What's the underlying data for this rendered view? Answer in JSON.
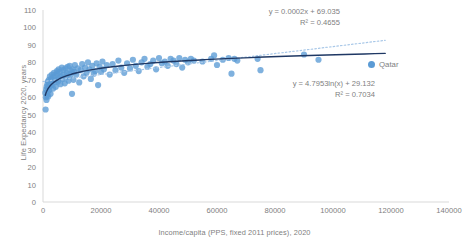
{
  "chart_data": {
    "type": "scatter",
    "title": "",
    "xlabel": "Income/capita (PPS, fixed 2011 prices), 2020",
    "ylabel": "Life Expectancy 2020, years",
    "xlim": [
      0,
      140000
    ],
    "ylim": [
      0,
      110
    ],
    "xticks": [
      0,
      20000,
      40000,
      60000,
      80000,
      100000,
      120000,
      140000
    ],
    "yticks": [
      0,
      10,
      20,
      30,
      40,
      50,
      60,
      70,
      80,
      90,
      100,
      110
    ],
    "grid": false,
    "legend_position": "right",
    "series": [
      {
        "name": "Qatar",
        "marker_color": "#5B9BD5",
        "points": [
          [
            800,
            62.5
          ],
          [
            900,
            53.0
          ],
          [
            1000,
            60.0
          ],
          [
            1100,
            64.5
          ],
          [
            1200,
            58.5
          ],
          [
            1250,
            66.0
          ],
          [
            1400,
            61.0
          ],
          [
            1500,
            67.5
          ],
          [
            1600,
            63.0
          ],
          [
            1700,
            69.0
          ],
          [
            1800,
            60.5
          ],
          [
            1900,
            65.5
          ],
          [
            2000,
            70.0
          ],
          [
            2100,
            64.0
          ],
          [
            2200,
            68.0
          ],
          [
            2400,
            72.0
          ],
          [
            2500,
            66.5
          ],
          [
            2600,
            62.0
          ],
          [
            2800,
            70.5
          ],
          [
            3000,
            67.0
          ],
          [
            3100,
            73.0
          ],
          [
            3300,
            69.5
          ],
          [
            3500,
            65.0
          ],
          [
            3600,
            71.5
          ],
          [
            3800,
            74.0
          ],
          [
            4000,
            68.5
          ],
          [
            4200,
            72.5
          ],
          [
            4400,
            66.0
          ],
          [
            4600,
            70.0
          ],
          [
            4800,
            75.0
          ],
          [
            5000,
            73.5
          ],
          [
            5200,
            69.0
          ],
          [
            5400,
            76.0
          ],
          [
            5600,
            71.0
          ],
          [
            5800,
            74.5
          ],
          [
            6000,
            67.5
          ],
          [
            6200,
            72.0
          ],
          [
            6500,
            77.0
          ],
          [
            6800,
            70.5
          ],
          [
            7000,
            75.5
          ],
          [
            7200,
            73.0
          ],
          [
            7500,
            68.0
          ],
          [
            7800,
            76.5
          ],
          [
            8000,
            71.5
          ],
          [
            8200,
            74.0
          ],
          [
            8500,
            77.5
          ],
          [
            8800,
            69.5
          ],
          [
            9000,
            73.5
          ],
          [
            9200,
            78.0
          ],
          [
            9500,
            72.5
          ],
          [
            9800,
            75.0
          ],
          [
            10000,
            62.0
          ],
          [
            10200,
            76.0
          ],
          [
            10500,
            70.0
          ],
          [
            10800,
            74.5
          ],
          [
            11000,
            78.5
          ],
          [
            11500,
            73.0
          ],
          [
            12000,
            76.5
          ],
          [
            12500,
            68.5
          ],
          [
            13000,
            75.5
          ],
          [
            13500,
            79.0
          ],
          [
            14000,
            72.0
          ],
          [
            14500,
            77.0
          ],
          [
            15000,
            74.0
          ],
          [
            15500,
            80.0
          ],
          [
            16000,
            76.0
          ],
          [
            16500,
            70.5
          ],
          [
            17000,
            78.0
          ],
          [
            17500,
            73.5
          ],
          [
            18000,
            75.0
          ],
          [
            18500,
            79.5
          ],
          [
            19000,
            67.0
          ],
          [
            19500,
            77.5
          ],
          [
            20000,
            74.5
          ],
          [
            20500,
            80.5
          ],
          [
            21000,
            76.0
          ],
          [
            22000,
            78.5
          ],
          [
            23000,
            73.0
          ],
          [
            24000,
            79.0
          ],
          [
            25000,
            75.5
          ],
          [
            26000,
            81.0
          ],
          [
            27000,
            77.0
          ],
          [
            28000,
            74.0
          ],
          [
            29000,
            79.5
          ],
          [
            30000,
            76.5
          ],
          [
            31000,
            81.5
          ],
          [
            32000,
            78.0
          ],
          [
            33000,
            75.0
          ],
          [
            34000,
            80.0
          ],
          [
            35000,
            82.0
          ],
          [
            36000,
            77.5
          ],
          [
            37000,
            79.0
          ],
          [
            38000,
            81.0
          ],
          [
            39000,
            76.0
          ],
          [
            40000,
            82.5
          ],
          [
            41000,
            79.5
          ],
          [
            42000,
            80.5
          ],
          [
            43000,
            78.0
          ],
          [
            44000,
            82.0
          ],
          [
            45000,
            81.0
          ],
          [
            46000,
            79.0
          ],
          [
            47000,
            82.5
          ],
          [
            48000,
            77.0
          ],
          [
            49000,
            81.5
          ],
          [
            50000,
            80.0
          ],
          [
            51000,
            82.0
          ],
          [
            52000,
            81.0
          ],
          [
            55000,
            80.5
          ],
          [
            58000,
            82.0
          ],
          [
            59000,
            84.0
          ],
          [
            60000,
            78.5
          ],
          [
            62000,
            81.5
          ],
          [
            64000,
            82.5
          ],
          [
            65000,
            73.5
          ],
          [
            66000,
            82.0
          ],
          [
            67000,
            81.0
          ],
          [
            74000,
            82.0
          ],
          [
            75000,
            75.5
          ],
          [
            90000,
            84.5
          ],
          [
            95000,
            81.5
          ]
        ]
      }
    ],
    "trendlines": [
      {
        "name": "linear",
        "equation": "y = 0.0002x + 69.035",
        "r_squared": "R² = 0.4655",
        "style": "dotted",
        "color": "#A9C8E8",
        "intercept": 69.035,
        "slope": 0.0002,
        "x_start": 0,
        "x_end": 118000
      },
      {
        "name": "logarithmic",
        "equation": "y = 4.7953ln(x) + 29.132",
        "r_squared": "R² = 0.7034",
        "style": "solid",
        "color": "#1F3864",
        "coefficient": 4.7953,
        "intercept": 29.132,
        "x_start": 800,
        "x_end": 118000
      }
    ]
  },
  "legend": {
    "marker_color": "#5B9BD5",
    "label": "Qatar"
  },
  "annotations": {
    "linear_equation": "y = 0.0002x + 69.035",
    "linear_r2": "R² = 0.4655",
    "log_equation": "y = 4.7953ln(x) + 29.132",
    "log_r2": "R² = 0.7034"
  },
  "colors": {
    "marker": "#5B9BD5",
    "log_trend": "#1F3864",
    "linear_trend": "#A9C8E8",
    "axis": "#D9D9D9",
    "text": "#808080"
  }
}
